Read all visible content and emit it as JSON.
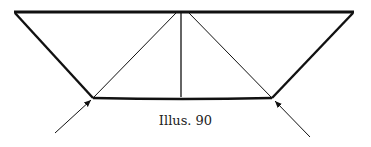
{
  "diagram": {
    "caption": "Illus. 90",
    "stroke_color": "#111111",
    "frame": {
      "top_left": [
        14,
        12
      ],
      "top_right": [
        354,
        12
      ],
      "bottom_left": [
        93,
        98
      ],
      "bottom_right": [
        272,
        98
      ]
    },
    "center_post": {
      "top": [
        181,
        12
      ],
      "bottom": [
        181,
        97
      ]
    },
    "braces": [
      {
        "from": [
          93,
          98
        ],
        "to": [
          176,
          13
        ]
      },
      {
        "from": [
          272,
          98
        ],
        "to": [
          188,
          13
        ]
      }
    ],
    "arrows": [
      {
        "from": [
          55,
          133
        ],
        "to": [
          91,
          100
        ]
      },
      {
        "from": [
          310,
          137
        ],
        "to": [
          275,
          101
        ]
      }
    ]
  }
}
